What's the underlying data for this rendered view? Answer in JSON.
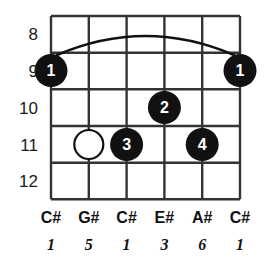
{
  "diagram": {
    "type": "guitar-chord-diagram",
    "title": "",
    "strings": 6,
    "frets": 5,
    "colors": {
      "grid": "#333333",
      "dot_fill": "#111111",
      "dot_text": "#ffffff",
      "open_circle_stroke": "#111111",
      "background": "#ffffff",
      "text": "#111111"
    },
    "fret_numbers": [
      "8",
      "9",
      "10",
      "11",
      "12"
    ],
    "note_names": [
      "C#",
      "G#",
      "C#",
      "E#",
      "A#",
      "C#"
    ],
    "intervals": [
      "1",
      "5",
      "1",
      "3",
      "6",
      "1"
    ],
    "barre": {
      "present": true,
      "fret": "9",
      "from_string": 1,
      "to_string": 6
    },
    "markers": [
      {
        "kind": "filled",
        "label": "1",
        "string": 1,
        "fret": "9"
      },
      {
        "kind": "open",
        "label": "",
        "string": 2,
        "fret": "11"
      },
      {
        "kind": "filled",
        "label": "3",
        "string": 3,
        "fret": "11"
      },
      {
        "kind": "filled",
        "label": "2",
        "string": 4,
        "fret": "10"
      },
      {
        "kind": "filled",
        "label": "4",
        "string": 5,
        "fret": "11"
      },
      {
        "kind": "filled",
        "label": "1",
        "string": 6,
        "fret": "9"
      }
    ]
  }
}
